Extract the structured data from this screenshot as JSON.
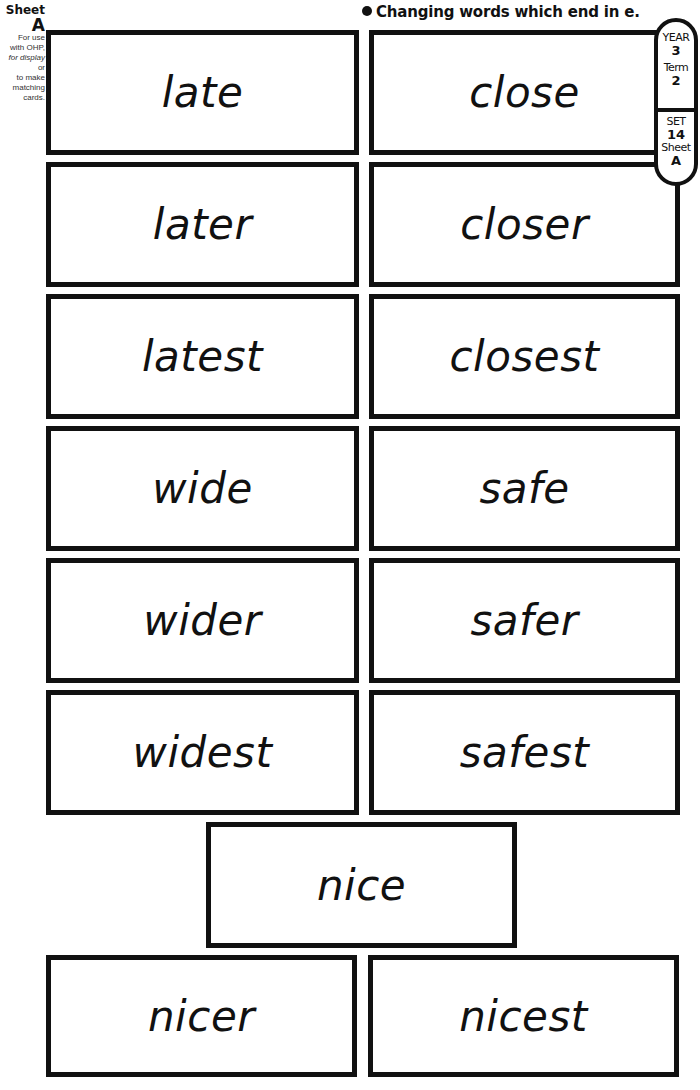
{
  "sheet_label": {
    "word": "Sheet",
    "letter": "A",
    "usage_lines": [
      "For use",
      "with OHP,",
      "for display",
      "or",
      "to make",
      "matching",
      "cards."
    ]
  },
  "title": "Changing words which end in e.",
  "tab": {
    "year_label": "YEAR",
    "year_value": "3",
    "term_label": "Term",
    "term_value": "2",
    "set_label": "SET",
    "set_value": "14",
    "sheet_label": "Sheet",
    "sheet_value": "A"
  },
  "cards": [
    {
      "word": "late"
    },
    {
      "word": "close"
    },
    {
      "word": "later"
    },
    {
      "word": "closer"
    },
    {
      "word": "latest"
    },
    {
      "word": "closest"
    },
    {
      "word": "wide"
    },
    {
      "word": "safe"
    },
    {
      "word": "wider"
    },
    {
      "word": "safer"
    },
    {
      "word": "widest"
    },
    {
      "word": "safest"
    },
    {
      "word": "nice"
    },
    {
      "word": "nicer"
    },
    {
      "word": "nicest"
    }
  ],
  "footer": ""
}
